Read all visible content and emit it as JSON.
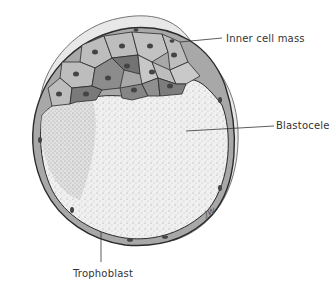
{
  "figure": {
    "labels": [
      {
        "id": "inner-cell-mass",
        "text": "Inner cell mass"
      },
      {
        "id": "blastocele",
        "text": "Blastocele"
      },
      {
        "id": "trophoblast",
        "text": "Trophoblast"
      }
    ],
    "signature": "JW",
    "colors": {
      "outer_shell": "#e6e6e6",
      "trophoblast_layer": "#a9a9a9",
      "icm_light": "#bdbdbd",
      "icm_mid": "#9a9a9a",
      "icm_dark": "#737373",
      "cavity": "#efefef",
      "outline": "#2b2b2b"
    }
  }
}
